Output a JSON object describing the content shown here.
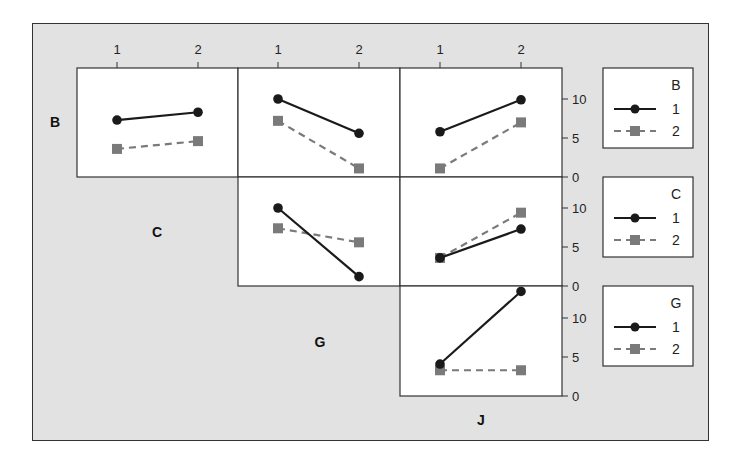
{
  "chart_data": {
    "type": "line",
    "factors": [
      "B",
      "C",
      "G",
      "J"
    ],
    "x_tick_labels": [
      "1",
      "2"
    ],
    "y_ticks": [
      0,
      5,
      10
    ],
    "ylim": [
      0,
      13.5
    ],
    "legend_levels": [
      "1",
      "2"
    ],
    "series_style": {
      "level_1": {
        "line": "solid",
        "marker": "circle",
        "color": "#1a1a1a"
      },
      "level_2": {
        "line": "dashed",
        "marker": "square",
        "color": "#7a7a7a"
      }
    },
    "panels": [
      {
        "row_factor": "B",
        "col_factor": "C",
        "series": [
          {
            "name": "B=1",
            "values": [
              7.3,
              8.3
            ]
          },
          {
            "name": "B=2",
            "values": [
              3.6,
              4.6
            ]
          }
        ]
      },
      {
        "row_factor": "B",
        "col_factor": "G",
        "series": [
          {
            "name": "B=1",
            "values": [
              10.0,
              5.6
            ]
          },
          {
            "name": "B=2",
            "values": [
              7.2,
              1.1
            ]
          }
        ]
      },
      {
        "row_factor": "B",
        "col_factor": "J",
        "series": [
          {
            "name": "B=1",
            "values": [
              5.8,
              9.9
            ]
          },
          {
            "name": "B=2",
            "values": [
              1.1,
              7.0
            ]
          }
        ]
      },
      {
        "row_factor": "C",
        "col_factor": "G",
        "series": [
          {
            "name": "C=1",
            "values": [
              10.0,
              1.2
            ]
          },
          {
            "name": "C=2",
            "values": [
              7.4,
              5.6
            ]
          }
        ]
      },
      {
        "row_factor": "C",
        "col_factor": "J",
        "series": [
          {
            "name": "C=1",
            "values": [
              3.6,
              7.3
            ]
          },
          {
            "name": "C=2",
            "values": [
              3.6,
              9.4
            ]
          }
        ]
      },
      {
        "row_factor": "G",
        "col_factor": "J",
        "series": [
          {
            "name": "G=1",
            "values": [
              4.1,
              13.4
            ]
          },
          {
            "name": "G=2",
            "values": [
              3.3,
              3.3
            ]
          }
        ]
      }
    ],
    "legends": [
      {
        "title": "B",
        "items": [
          "1",
          "2"
        ]
      },
      {
        "title": "C",
        "items": [
          "1",
          "2"
        ]
      },
      {
        "title": "G",
        "items": [
          "1",
          "2"
        ]
      }
    ],
    "row_labels": [
      "B",
      "C",
      "G",
      "J"
    ],
    "grid": false
  }
}
